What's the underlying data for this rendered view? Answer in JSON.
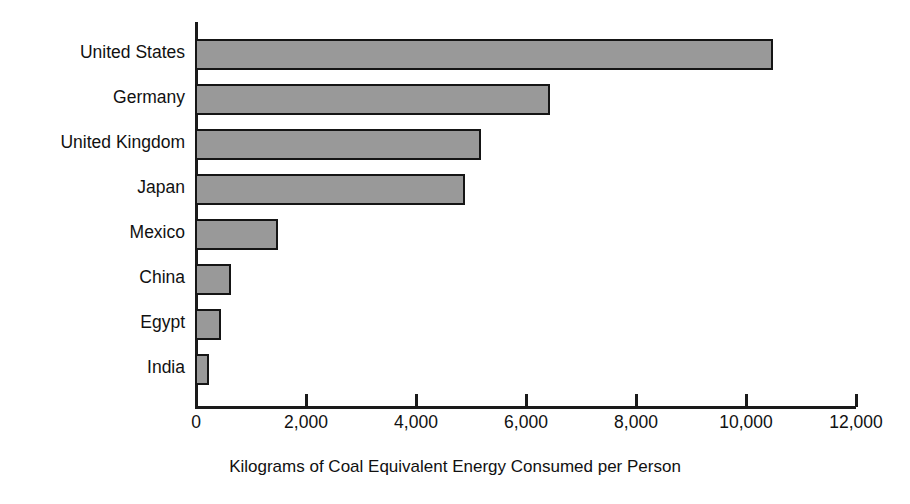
{
  "chart_data": {
    "type": "bar",
    "orientation": "horizontal",
    "title": "",
    "xlabel": "Kilograms of Coal Equivalent Energy Consumed per Person",
    "ylabel": "",
    "categories": [
      "United States",
      "Germany",
      "United Kingdom",
      "Japan",
      "Mexico",
      "China",
      "Egypt",
      "India"
    ],
    "values": [
      10500,
      6450,
      5200,
      4900,
      1500,
      650,
      480,
      250
    ],
    "xlim": [
      0,
      12000
    ],
    "xticks": [
      0,
      2000,
      4000,
      6000,
      8000,
      10000,
      12000
    ],
    "xtick_labels": [
      "0",
      "2,000",
      "4,000",
      "6,000",
      "8,000",
      "10,000",
      "12,000"
    ],
    "grid": false,
    "legend": null,
    "bar_fill_color": "#999999",
    "bar_border_color": "#151515",
    "axis_color": "#1a1a1a",
    "background_color": "#ffffff"
  }
}
